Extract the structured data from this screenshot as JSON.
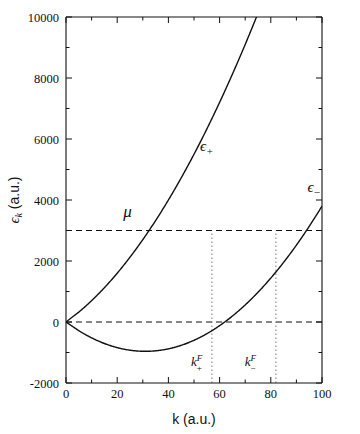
{
  "chart_data": {
    "type": "line",
    "title": "",
    "xlabel": "k (a.u.)",
    "ylabel": "ε_k (a.u.)",
    "ylabel_base": "ϵ",
    "ylabel_sub": "k",
    "ylabel_units": "(a.u.)",
    "xlim": [
      0,
      100
    ],
    "ylim": [
      -2000,
      10000
    ],
    "xticks": [
      0,
      20,
      40,
      60,
      80,
      100
    ],
    "xtick_labels": [
      "0",
      "20",
      "40",
      "60",
      "80",
      "100"
    ],
    "xminor_ticks": [
      10,
      30,
      50,
      70,
      90
    ],
    "yticks": [
      -2000,
      0,
      2000,
      4000,
      6000,
      8000,
      10000
    ],
    "ytick_labels": [
      "-2000",
      "0",
      "2000",
      "4000",
      "6000",
      "8000",
      "10000"
    ],
    "yminor_ticks": [
      -1000,
      1000,
      3000,
      5000,
      7000,
      9000
    ],
    "grid": false,
    "legend": "none",
    "series": [
      {
        "name": "ϵ+",
        "label": "ϵ",
        "label_sub": "+",
        "label_x": 55,
        "label_y": 5600,
        "style": "solid",
        "formula": "k^2 + 120k",
        "x": [
          0,
          5,
          10,
          15,
          20,
          25,
          30,
          35,
          40,
          45,
          50,
          55,
          60,
          65,
          70,
          75,
          80,
          85,
          90,
          95,
          100
        ],
        "y": [
          0,
          325,
          700,
          1125,
          1600,
          2125,
          2700,
          3325,
          4000,
          4725,
          5500,
          6325,
          7200,
          8125,
          9100,
          10125,
          11200,
          12325,
          13500,
          14725,
          16000
        ]
      },
      {
        "name": "ϵ-",
        "label": "ϵ",
        "label_sub": "−",
        "label_x": 97,
        "label_y": 4250,
        "style": "solid",
        "formula": "k^2 - 62k",
        "x": [
          0,
          5,
          10,
          15,
          20,
          25,
          30,
          35,
          40,
          45,
          50,
          55,
          60,
          65,
          70,
          75,
          80,
          85,
          90,
          95,
          100
        ],
        "y": [
          0,
          -285,
          -520,
          -705,
          -840,
          -925,
          -960,
          -945,
          -880,
          -765,
          -600,
          -385,
          -120,
          195,
          560,
          975,
          1440,
          1955,
          2520,
          3135,
          3800
        ]
      }
    ],
    "hlines": [
      {
        "name": "mu-level",
        "value": 3000,
        "style": "dashed",
        "label": "μ",
        "label_x": 24,
        "label_y": 3450
      },
      {
        "name": "zero-level",
        "value": 0,
        "style": "dashed",
        "label": ""
      }
    ],
    "vlines": [
      {
        "name": "kF-plus",
        "value": 57,
        "from": -2000,
        "to": 3000,
        "style": "dotted"
      },
      {
        "name": "kF-minus",
        "value": 82,
        "from": -2000,
        "to": 3000,
        "style": "dotted"
      }
    ],
    "annotations": [
      {
        "name": "kF-plus-label",
        "base": "k",
        "sup": "F",
        "sub": "+",
        "x": 51,
        "y": -1450
      },
      {
        "name": "kF-minus-label",
        "base": "k",
        "sup": "F",
        "sub": "−",
        "x": 72,
        "y": -1450
      }
    ]
  }
}
